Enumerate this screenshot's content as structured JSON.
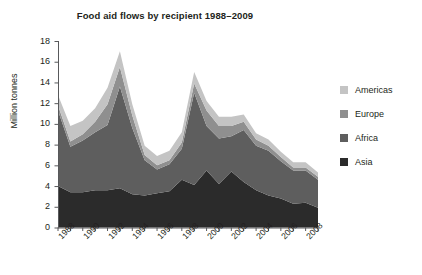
{
  "chart_data": {
    "type": "area",
    "stacked": true,
    "title": "Food aid flows by recipient 1988–2009",
    "xlabel": "",
    "ylabel": "Million tonnes",
    "ylim": [
      0,
      18
    ],
    "ytick_step": 2,
    "yticks": [
      "0",
      "2",
      "4",
      "6",
      "8",
      "10",
      "12",
      "14",
      "16",
      "18"
    ],
    "grid": false,
    "legend_position": "right",
    "x": [
      1988,
      1989,
      1990,
      1991,
      1992,
      1993,
      1994,
      1995,
      1996,
      1997,
      1998,
      1999,
      2000,
      2001,
      2002,
      2003,
      2004,
      2005,
      2006,
      2007,
      2008,
      2009
    ],
    "xtick_labels": [
      "1988",
      "1990",
      "1992",
      "1994",
      "1996",
      "1998",
      "2000",
      "2002",
      "2004",
      "2006",
      "2008"
    ],
    "xtick_values": [
      1988,
      1990,
      1992,
      1994,
      1996,
      1998,
      2000,
      2002,
      2004,
      2006,
      2008
    ],
    "series": [
      {
        "name": "Asia",
        "color": "#2b2b2b",
        "values": [
          4.0,
          3.4,
          3.4,
          3.6,
          3.6,
          3.8,
          3.2,
          3.1,
          3.3,
          3.5,
          4.6,
          4.1,
          5.5,
          4.2,
          5.4,
          4.4,
          3.6,
          3.1,
          2.8,
          2.3,
          2.4,
          1.9
        ]
      },
      {
        "name": "Africa",
        "color": "#5e5e5e",
        "values": [
          7.3,
          4.4,
          5.0,
          5.6,
          6.3,
          9.8,
          6.4,
          3.4,
          2.3,
          2.6,
          3.0,
          8.9,
          4.3,
          4.4,
          3.4,
          5.0,
          4.3,
          4.3,
          3.6,
          3.2,
          3.1,
          2.7
        ]
      },
      {
        "name": "Europe",
        "color": "#8f8f8f",
        "values": [
          0.5,
          0.5,
          0.6,
          1.0,
          2.0,
          1.9,
          1.2,
          0.5,
          0.4,
          0.4,
          0.6,
          0.9,
          1.5,
          1.2,
          1.0,
          0.8,
          0.6,
          0.5,
          0.4,
          0.3,
          0.3,
          0.3
        ]
      },
      {
        "name": "Americas",
        "color": "#c4c4c4",
        "values": [
          1.0,
          1.5,
          1.3,
          1.3,
          1.6,
          1.5,
          1.1,
          0.9,
          0.9,
          0.9,
          1.0,
          1.1,
          0.9,
          0.9,
          0.9,
          0.7,
          0.6,
          0.6,
          0.5,
          0.5,
          0.5,
          0.4
        ]
      }
    ]
  },
  "legend": {
    "items": [
      {
        "label": "Americas",
        "color": "#c4c4c4"
      },
      {
        "label": "Europe",
        "color": "#8f8f8f"
      },
      {
        "label": "Africa",
        "color": "#5e5e5e"
      },
      {
        "label": "Asia",
        "color": "#2b2b2b"
      }
    ]
  },
  "axis": {
    "line_color": "#58595b"
  }
}
